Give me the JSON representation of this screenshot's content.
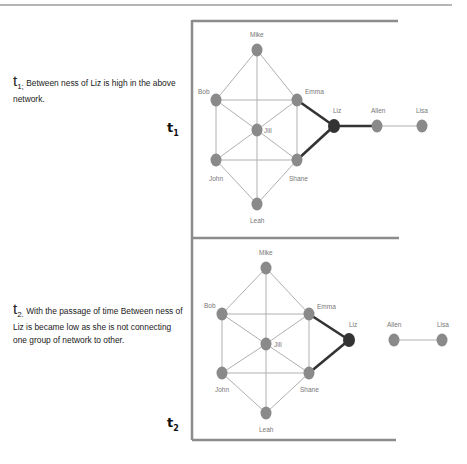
{
  "descriptions": {
    "t1": {
      "label": "t",
      "sub": "1;",
      "text": " Between ness of Liz is high in the above network."
    },
    "t2": {
      "label": "t",
      "sub": "2.",
      "text": " With the passage of time Between ness of Liz is became low as she is not connecting one group of network to other."
    }
  },
  "panel_labels": {
    "t1": {
      "label": "t",
      "sub": "1"
    },
    "t2": {
      "label": "t",
      "sub": "2"
    }
  },
  "colors": {
    "node": "#8a8a8a",
    "liz_node": "#333333",
    "edge": "#b0b0b0",
    "liz_edge": "#333333",
    "frame": "#8c8c8c"
  },
  "networks": {
    "t1": {
      "nodes": {
        "mike": {
          "label": "Mike"
        },
        "bob": {
          "label": "Bob"
        },
        "emma": {
          "label": "Emma"
        },
        "jill": {
          "label": "Jill"
        },
        "john": {
          "label": "John"
        },
        "shane": {
          "label": "Shane"
        },
        "leah": {
          "label": "Leah"
        },
        "liz": {
          "label": "Liz"
        },
        "allen": {
          "label": "Allen"
        },
        "lisa": {
          "label": "Lisa"
        }
      },
      "edges": [
        [
          "Mike",
          "Bob"
        ],
        [
          "Mike",
          "Emma"
        ],
        [
          "Mike",
          "Jill"
        ],
        [
          "Bob",
          "Emma"
        ],
        [
          "Bob",
          "Jill"
        ],
        [
          "Bob",
          "John"
        ],
        [
          "Emma",
          "Jill"
        ],
        [
          "Emma",
          "Shane"
        ],
        [
          "Jill",
          "John"
        ],
        [
          "Jill",
          "Shane"
        ],
        [
          "Jill",
          "Leah"
        ],
        [
          "John",
          "Shane"
        ],
        [
          "John",
          "Leah"
        ],
        [
          "Shane",
          "Leah"
        ],
        [
          "Emma",
          "Liz"
        ],
        [
          "Shane",
          "Liz"
        ],
        [
          "Liz",
          "Allen"
        ],
        [
          "Allen",
          "Lisa"
        ]
      ]
    },
    "t2": {
      "nodes": {
        "mike": {
          "label": "Mike"
        },
        "bob": {
          "label": "Bob"
        },
        "emma": {
          "label": "Emma"
        },
        "jill": {
          "label": "Jill"
        },
        "john": {
          "label": "John"
        },
        "shane": {
          "label": "Shane"
        },
        "leah": {
          "label": "Leah"
        },
        "liz": {
          "label": "Liz"
        },
        "allen": {
          "label": "Allen"
        },
        "lisa": {
          "label": "Lisa"
        }
      },
      "edges": [
        [
          "Mike",
          "Bob"
        ],
        [
          "Mike",
          "Emma"
        ],
        [
          "Mike",
          "Jill"
        ],
        [
          "Bob",
          "Emma"
        ],
        [
          "Bob",
          "Jill"
        ],
        [
          "Bob",
          "John"
        ],
        [
          "Emma",
          "Jill"
        ],
        [
          "Emma",
          "Shane"
        ],
        [
          "Jill",
          "John"
        ],
        [
          "Jill",
          "Shane"
        ],
        [
          "Jill",
          "Leah"
        ],
        [
          "John",
          "Shane"
        ],
        [
          "John",
          "Leah"
        ],
        [
          "Shane",
          "Leah"
        ],
        [
          "Emma",
          "Liz"
        ],
        [
          "Shane",
          "Liz"
        ],
        [
          "Allen",
          "Lisa"
        ]
      ]
    }
  }
}
